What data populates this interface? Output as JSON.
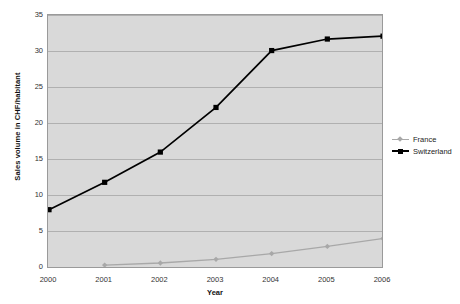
{
  "chart_data": {
    "type": "line",
    "title": "",
    "xlabel": "Year",
    "ylabel": "Sales volume in CHF/habitant",
    "categories": [
      "2000",
      "2001",
      "2002",
      "2003",
      "2004",
      "2005",
      "2006"
    ],
    "x": [
      2000,
      2001,
      2002,
      2003,
      2004,
      2005,
      2006
    ],
    "xlim": [
      2000,
      2006
    ],
    "ylim": [
      0,
      35
    ],
    "yticks": [
      0,
      5,
      10,
      15,
      20,
      25,
      30,
      35
    ],
    "ytick_labels": [
      "0",
      "5",
      "10",
      "15",
      "20",
      "25",
      "30",
      "35"
    ],
    "grid": true,
    "legend_position": "right",
    "plot_background": "#d9d9d9",
    "series": [
      {
        "name": "France",
        "color": "#a8a8a8",
        "marker": "diamond",
        "values": [
          null,
          0.4,
          0.7,
          1.2,
          2.0,
          3.0,
          4.1
        ]
      },
      {
        "name": "Switzerland",
        "color": "#000000",
        "marker": "square",
        "values": [
          8.1,
          11.9,
          16.1,
          22.3,
          30.2,
          31.8,
          32.2
        ]
      }
    ]
  },
  "legend": {
    "items": [
      {
        "label": "France"
      },
      {
        "label": "Switzerland"
      }
    ]
  }
}
